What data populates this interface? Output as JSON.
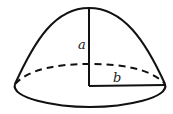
{
  "diagram": {
    "title": "",
    "shape": "paraboloid",
    "labels": {
      "height": "a",
      "radius": "b"
    },
    "colors": {
      "stroke": "#111111",
      "background": "#ffffff"
    }
  }
}
